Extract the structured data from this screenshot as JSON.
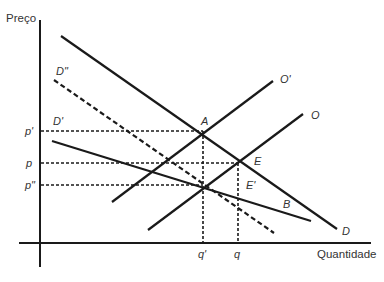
{
  "diagram": {
    "axes": {
      "y_label": "Preço",
      "x_label": "Quantidade"
    },
    "price_levels": [
      {
        "label": "p'",
        "y": 131
      },
      {
        "label": "p",
        "y": 163
      },
      {
        "label": "p\"",
        "y": 185
      }
    ],
    "quantity_levels": [
      {
        "label": "q'",
        "x": 203
      },
      {
        "label": "q",
        "x": 238
      }
    ],
    "curves": [
      {
        "id": "D",
        "label": "D",
        "style": "solid",
        "from": [
          61,
          36
        ],
        "to": [
          337,
          229
        ]
      },
      {
        "id": "D2",
        "label": "D\"",
        "style": "dashed",
        "from": [
          54,
          80
        ],
        "to": [
          274,
          233
        ]
      },
      {
        "id": "D1",
        "label": "D'",
        "style": "solid",
        "from": [
          52,
          141
        ],
        "to": [
          311,
          221
        ]
      },
      {
        "id": "O1",
        "label": "O'",
        "style": "solid",
        "from": [
          112,
          202
        ],
        "to": [
          273,
          81
        ]
      },
      {
        "id": "O",
        "label": "O",
        "style": "solid",
        "from": [
          148,
          230
        ],
        "to": [
          303,
          114
        ]
      }
    ],
    "points": [
      {
        "label": "A",
        "x": 203,
        "y": 131
      },
      {
        "label": "E",
        "x": 240,
        "y": 163
      },
      {
        "label": "E'",
        "x": 238,
        "y": 185
      },
      {
        "label": "B",
        "x": 287,
        "y": 205
      }
    ],
    "colors": {
      "line": "#1a1a1a",
      "text": "#333333",
      "background": "#ffffff"
    }
  }
}
